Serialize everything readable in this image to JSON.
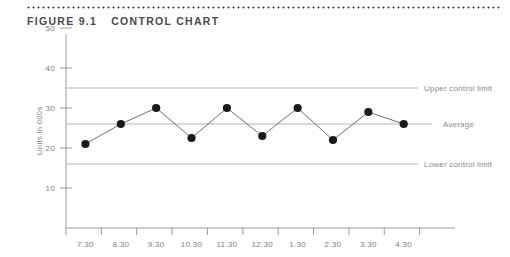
{
  "figure": {
    "number": "Figure 9.1",
    "title": "Control chart"
  },
  "chart_data": {
    "type": "line",
    "title": "Control chart",
    "xlabel": "",
    "ylabel": "Units in 000s",
    "categories": [
      "7.30",
      "8.30",
      "9.30",
      "10.30",
      "11.30",
      "12.30",
      "1.30",
      "2.30",
      "3.30",
      "4.30"
    ],
    "values": [
      21,
      26,
      30,
      22.5,
      30,
      23,
      30,
      22,
      29,
      26
    ],
    "series": [
      {
        "name": "Units in 000s",
        "values": [
          21,
          26,
          30,
          22.5,
          30,
          23,
          30,
          22,
          29,
          26
        ]
      }
    ],
    "ylim": [
      0,
      55
    ],
    "yticks": [
      10,
      20,
      30,
      40,
      50
    ],
    "ytick_labels": [
      "10",
      "20",
      "30",
      "40",
      "50"
    ],
    "grid": false,
    "legend": "right-inline",
    "reference_lines": [
      {
        "name": "upper-control-limit",
        "label": "Upper control limit",
        "value": 35
      },
      {
        "name": "average",
        "label": "Average",
        "value": 26
      },
      {
        "name": "lower-control-limit",
        "label": "Lower control limit",
        "value": 16
      }
    ],
    "marker": "filled-circle",
    "marker_color": "#1a1a1a",
    "line_color": "#6f6f6f",
    "reference_line_color": "#b4b4b4",
    "axis_color": "#9a9a9a"
  }
}
